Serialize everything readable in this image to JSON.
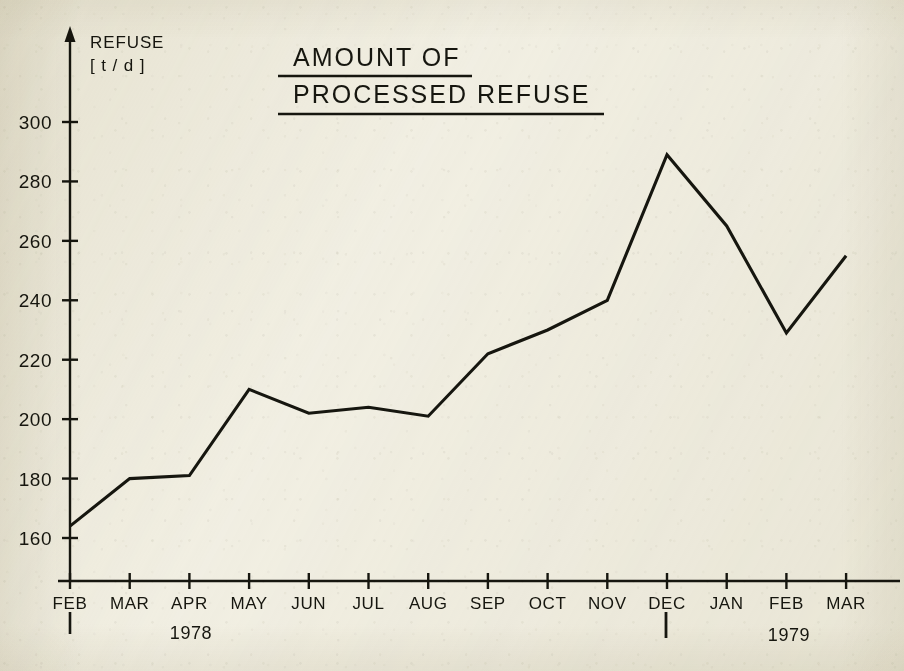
{
  "figure": {
    "title_line1": "AMOUNT OF",
    "title_line2": "PROCESSED REFUSE",
    "y_axis_name_line1": "REFUSE",
    "y_axis_name_line2": "[ t / d ]",
    "year_left": "1978",
    "year_right": "1979",
    "caption": "",
    "ink_color": "#16160f",
    "paper_color": "#f3f1e7"
  },
  "chart_data": {
    "type": "line",
    "title": "AMOUNT OF PROCESSED REFUSE",
    "xlabel": "",
    "ylabel": "REFUSE [ t / d ]",
    "grid": false,
    "legend": "none",
    "ylim": [
      150,
      310
    ],
    "yticks": [
      160,
      180,
      200,
      220,
      240,
      260,
      280,
      300
    ],
    "ytick_labels": [
      "160",
      "180",
      "200",
      "220",
      "240",
      "260",
      "280",
      "300"
    ],
    "categories": [
      "FEB",
      "MAR",
      "APR",
      "MAY",
      "JUN",
      "JUL",
      "AUG",
      "SEP",
      "OCT",
      "NOV",
      "DEC",
      "JAN",
      "FEB",
      "MAR"
    ],
    "year_groups": [
      {
        "label": "1978",
        "start_category": "FEB",
        "end_category": "DEC"
      },
      {
        "label": "1979",
        "start_category": "JAN",
        "end_category": "MAR"
      }
    ],
    "values": [
      164,
      180,
      181,
      210,
      202,
      204,
      201,
      222,
      230,
      240,
      289,
      265,
      229,
      255
    ],
    "series": [
      {
        "name": "Processed refuse",
        "values": [
          164,
          180,
          181,
          210,
          202,
          204,
          201,
          222,
          230,
          240,
          289,
          265,
          229,
          255
        ]
      }
    ],
    "units": "t/d"
  }
}
